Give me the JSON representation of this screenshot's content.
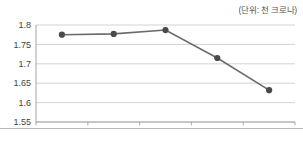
{
  "unit_note": "(단위: 천 크로나)",
  "chart_data": {
    "type": "line",
    "title": "",
    "subtitle": "",
    "xlabel": "",
    "ylabel": "",
    "unit_note": "(단위: 천 크로나)",
    "categories": [
      "2011",
      "2012",
      "2013",
      "2014",
      "2015"
    ],
    "values": [
      1.775,
      1.777,
      1.787,
      1.715,
      1.632
    ],
    "series": [
      {
        "name": "",
        "values": [
          1.775,
          1.777,
          1.787,
          1.715,
          1.632
        ]
      }
    ],
    "ylim": [
      1.55,
      1.8
    ],
    "ytick_labels": [
      "1.55",
      "1.6",
      "1.65",
      "1.7",
      "1.75",
      "1.8"
    ],
    "ytick_values": [
      1.55,
      1.6,
      1.65,
      1.7,
      1.75,
      1.8
    ],
    "xtick_labels": [
      "2011",
      "2012",
      "2013",
      "2014",
      "2015"
    ],
    "grid": true,
    "grid_axis": "y",
    "legend": false,
    "legend_position": "none",
    "marker": "circle",
    "line_color": "#6b6b6b",
    "marker_color": "#4a4a4a",
    "grid_color": "#c8c8c8",
    "axis_color": "#9a9a9a"
  }
}
